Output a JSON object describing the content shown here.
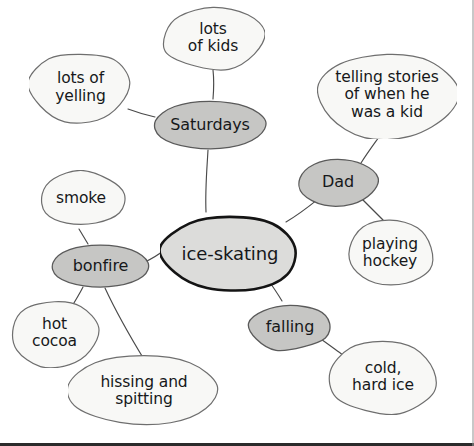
{
  "diagram": {
    "type": "mind-map",
    "background_color": "#ffffff",
    "palette": {
      "center_fill": "#dcdcda",
      "center_stroke": "#141414",
      "branch_fill": "#c6c6c4",
      "branch_stroke": "#5a5a5a",
      "leaf_fill": "#f8f8f6",
      "leaf_stroke": "#6e6e6e",
      "edge_stroke": "#4a4a4a",
      "text_color": "#16181a"
    },
    "nodes": [
      {
        "id": "ice-skating",
        "label": "ice-skating",
        "level": "center",
        "shape": "blob",
        "fill": "#dcdcda",
        "stroke": "#141414",
        "stroke_width": 2.6,
        "x": 160,
        "y": 213,
        "w": 140,
        "h": 82
      },
      {
        "id": "saturdays",
        "label": "Saturdays",
        "level": "branch",
        "shape": "ellipse",
        "fill": "#c6c6c4",
        "stroke": "#5a5a5a",
        "stroke_width": 1.3,
        "x": 152,
        "y": 99,
        "w": 116,
        "h": 52
      },
      {
        "id": "dad",
        "label": "Dad",
        "level": "branch",
        "shape": "blob",
        "fill": "#c6c6c4",
        "stroke": "#5a5a5a",
        "stroke_width": 1.3,
        "x": 297,
        "y": 157,
        "w": 82,
        "h": 50
      },
      {
        "id": "falling",
        "label": "falling",
        "level": "branch",
        "shape": "blob",
        "fill": "#c6c6c4",
        "stroke": "#5a5a5a",
        "stroke_width": 1.3,
        "x": 246,
        "y": 302,
        "w": 88,
        "h": 50
      },
      {
        "id": "bonfire",
        "label": "bonfire",
        "level": "branch",
        "shape": "ellipse",
        "fill": "#c6c6c4",
        "stroke": "#5a5a5a",
        "stroke_width": 1.3,
        "x": 50,
        "y": 243,
        "w": 101,
        "h": 46
      },
      {
        "id": "lots-of-kids",
        "label": "lots\nof kids",
        "level": "leaf",
        "shape": "blob",
        "fill": "#f8f8f6",
        "stroke": "#6e6e6e",
        "stroke_width": 1.2,
        "x": 161,
        "y": 5,
        "w": 104,
        "h": 66
      },
      {
        "id": "lots-of-yelling",
        "label": "lots of\nyelling",
        "level": "leaf",
        "shape": "blob",
        "fill": "#f8f8f6",
        "stroke": "#6e6e6e",
        "stroke_width": 1.2,
        "x": 29,
        "y": 50,
        "w": 103,
        "h": 75
      },
      {
        "id": "telling-stories",
        "label": "telling stories\nof when he\nwas a kid",
        "level": "leaf",
        "shape": "blob",
        "fill": "#f8f8f6",
        "stroke": "#6e6e6e",
        "stroke_width": 1.2,
        "x": 317,
        "y": 51,
        "w": 140,
        "h": 88
      },
      {
        "id": "playing-hockey",
        "label": "playing\nhockey",
        "level": "leaf",
        "shape": "blob",
        "fill": "#f8f8f6",
        "stroke": "#6e6e6e",
        "stroke_width": 1.2,
        "x": 344,
        "y": 219,
        "w": 92,
        "h": 68
      },
      {
        "id": "cold-hard-ice",
        "label": "cold,\nhard ice",
        "level": "leaf",
        "shape": "blob",
        "fill": "#f8f8f6",
        "stroke": "#6e6e6e",
        "stroke_width": 1.2,
        "x": 328,
        "y": 338,
        "w": 110,
        "h": 78
      },
      {
        "id": "smoke",
        "label": "smoke",
        "level": "leaf",
        "shape": "blob",
        "fill": "#f8f8f6",
        "stroke": "#6e6e6e",
        "stroke_width": 1.2,
        "x": 36,
        "y": 170,
        "w": 90,
        "h": 58
      },
      {
        "id": "hot-cocoa",
        "label": "hot\ncocoa",
        "level": "leaf",
        "shape": "blob",
        "fill": "#f8f8f6",
        "stroke": "#6e6e6e",
        "stroke_width": 1.2,
        "x": 9,
        "y": 298,
        "w": 91,
        "h": 70
      },
      {
        "id": "hissing-and-spitting",
        "label": "hissing and\nspitting",
        "level": "leaf",
        "shape": "blob",
        "fill": "#f8f8f6",
        "stroke": "#6e6e6e",
        "stroke_width": 1.2,
        "x": 68,
        "y": 353,
        "w": 152,
        "h": 76
      }
    ],
    "edges": [
      {
        "from": "ice-skating",
        "to": "saturdays",
        "path": "M 206 212 C 205 190 207 168 208 150"
      },
      {
        "from": "ice-skating",
        "to": "dad",
        "path": "M 286 222 C 300 214 312 204 322 196"
      },
      {
        "from": "ice-skating",
        "to": "falling",
        "path": "M 257 264 C 266 277 275 289 282 301"
      },
      {
        "from": "ice-skating",
        "to": "bonfire",
        "path": "M 163 251 C 157 256 151 259 145 262"
      },
      {
        "from": "saturdays",
        "to": "lots-of-kids",
        "path": "M 213 99 C 214 87 214 79 213 70"
      },
      {
        "from": "saturdays",
        "to": "lots-of-yelling",
        "path": "M 155 117 C 146 115 136 112 128 109"
      },
      {
        "from": "dad",
        "to": "telling-stories",
        "path": "M 361 163 C 368 152 374 144 379 137"
      },
      {
        "from": "dad",
        "to": "playing-hockey",
        "path": "M 362 199 C 370 207 377 214 383 220"
      },
      {
        "from": "falling",
        "to": "cold-hard-ice",
        "path": "M 318 337 C 328 344 336 350 343 355"
      },
      {
        "from": "bonfire",
        "to": "smoke",
        "path": "M 88 244 C 85 239 82 234 79 229"
      },
      {
        "from": "bonfire",
        "to": "hot-cocoa",
        "path": "M 83 287 C 79 295 74 303 69 311"
      },
      {
        "from": "bonfire",
        "to": "hissing-and-spitting",
        "path": "M 105 288 C 117 314 131 338 145 361"
      }
    ]
  }
}
